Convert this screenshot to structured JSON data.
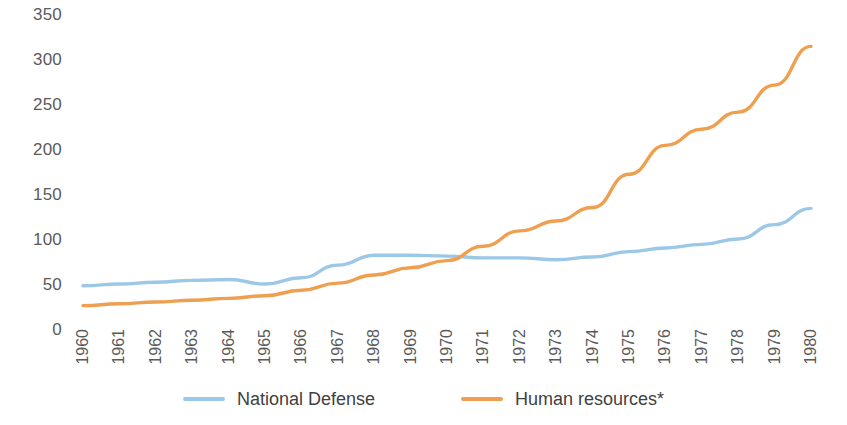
{
  "chart_data": {
    "type": "line",
    "title": "",
    "subtitle": "",
    "xlabel": "",
    "ylabel": "",
    "xlim": [
      1960,
      1980
    ],
    "ylim": [
      0,
      350
    ],
    "grid": false,
    "legend_position": "bottom",
    "y_ticks": [
      350,
      300,
      250,
      200,
      150,
      100,
      50,
      0
    ],
    "categories": [
      "1960",
      "1961",
      "1962",
      "1963",
      "1964",
      "1965",
      "1966",
      "1967",
      "1968",
      "1969",
      "1970",
      "1971",
      "1972",
      "1973",
      "1974",
      "1975",
      "1976",
      "1977",
      "1978",
      "1979",
      "1980"
    ],
    "series": [
      {
        "name": "National Defense",
        "color": "#9CC8E8",
        "values": [
          48,
          50,
          52,
          54,
          55,
          50,
          57,
          71,
          82,
          82,
          81,
          79,
          79,
          77,
          80,
          86,
          90,
          94,
          100,
          116,
          134
        ]
      },
      {
        "name": "Human resources*",
        "color": "#EE9F4F",
        "values": [
          26,
          28,
          30,
          32,
          34,
          37,
          43,
          51,
          60,
          68,
          76,
          92,
          109,
          120,
          135,
          172,
          204,
          222,
          241,
          271,
          314
        ]
      }
    ]
  },
  "legend": {
    "items": [
      {
        "label": "National Defense",
        "color": "#9CC8E8"
      },
      {
        "label": "Human resources*",
        "color": "#EE9F4F"
      }
    ]
  }
}
